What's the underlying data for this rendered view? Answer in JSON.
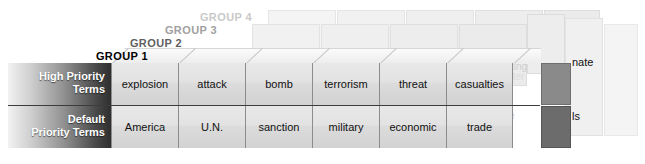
{
  "diagram": {
    "groups": [
      {
        "id": "group-1",
        "label": "GROUP 1",
        "color": "#000000"
      },
      {
        "id": "group-2",
        "label": "GROUP 2",
        "color": "#5f5f5f"
      },
      {
        "id": "group-3",
        "label": "GROUP 3",
        "color": "#a0a0a0"
      },
      {
        "id": "group-4",
        "label": "GROUP 4",
        "color": "#c9c9c9"
      }
    ],
    "rows": [
      {
        "id": "high-priority",
        "label_line1": "High Priority",
        "label_line2": "Terms",
        "cells": [
          "explosion",
          "attack",
          "bomb",
          "terrorism",
          "threat",
          "casualties"
        ]
      },
      {
        "id": "default-priority",
        "label_line1": "Default",
        "label_line2": "Priority Terms",
        "cells": [
          "America",
          "U.N.",
          "sanction",
          "military",
          "economic",
          "trade"
        ]
      }
    ],
    "partial_cells": [
      {
        "id": "partial-top",
        "text": "nate"
      },
      {
        "id": "partial-bottom",
        "text": "ls"
      }
    ],
    "background_terms": [
      {
        "text": "poli",
        "x": 148,
        "y": 66,
        "tier": "tier2"
      },
      {
        "text": "gas",
        "x": 225,
        "y": 66,
        "tier": "tier2"
      },
      {
        "text": "kil",
        "x": 303,
        "y": 66,
        "tier": "tier2"
      },
      {
        "text": "Anth",
        "x": 378,
        "y": 66,
        "tier": "tier2"
      },
      {
        "text": "retrib",
        "x": 432,
        "y": 66,
        "tier": "tier2"
      },
      {
        "text": "drinking",
        "x": 492,
        "y": 64,
        "tier": "tier2"
      },
      {
        "text": "water",
        "x": 498,
        "y": 73,
        "tier": "tier3"
      },
      {
        "text": "failu",
        "x": 150,
        "y": 113,
        "tier": "tier2"
      },
      {
        "text": "whi",
        "x": 212,
        "y": 110,
        "tier": "tier2"
      },
      {
        "text": "House",
        "x": 208,
        "y": 119,
        "tier": "tier3"
      },
      {
        "text": "presid",
        "x": 272,
        "y": 113,
        "tier": "tier2"
      },
      {
        "text": "D.C",
        "x": 378,
        "y": 113,
        "tier": "tier2"
      },
      {
        "text": "hm",
        "x": 440,
        "y": 113,
        "tier": "tier3"
      },
      {
        "text": "crime",
        "x": 490,
        "y": 113,
        "tier": "tier2"
      }
    ],
    "colors": {
      "background": "#ffffff",
      "cell_face": "#e2e2e2",
      "cell_border": "#8c8c8c",
      "row_separator": "#3c3c3c",
      "dark_cell": "#8a8a8a",
      "darker_cell": "#6c6c6c",
      "label_gradient_light": "#f2f2f2",
      "label_gradient_dark": "#2e2e2e",
      "label_text": "#ffffff",
      "slab_face": "#ececec",
      "slab_border": "#dddddd"
    }
  }
}
